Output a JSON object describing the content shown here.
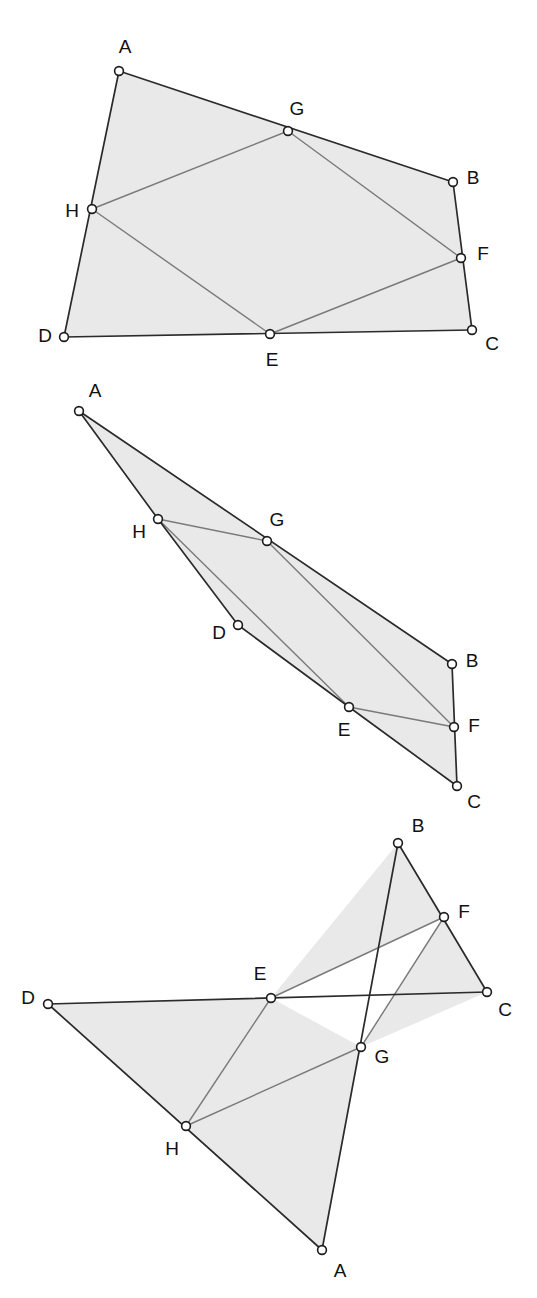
{
  "figure": {
    "width": 537,
    "height": 1298,
    "colors": {
      "background": "#ffffff",
      "fill": "#e9e9e9",
      "outer_edge": "#2b2b2b",
      "inner_edge": "#7a7a7a",
      "vertex_fill": "#ffffff",
      "vertex_stroke": "#1c1c1c",
      "label": "#111111"
    },
    "panels": [
      {
        "id": "panel-1",
        "name": "convex-quadrilateral-case",
        "points": {
          "A": {
            "x": 119,
            "y": 71,
            "label": "A",
            "lx": 125,
            "ly": 48
          },
          "B": {
            "x": 453,
            "y": 182,
            "label": "B",
            "lx": 473,
            "ly": 179
          },
          "C": {
            "x": 472,
            "y": 330,
            "label": "C",
            "lx": 492,
            "ly": 345
          },
          "D": {
            "x": 64,
            "y": 337,
            "label": "D",
            "lx": 45,
            "ly": 337
          },
          "E": {
            "x": 270,
            "y": 334,
            "label": "E",
            "lx": 272,
            "ly": 361
          },
          "F": {
            "x": 461,
            "y": 258,
            "label": "F",
            "lx": 483,
            "ly": 255
          },
          "G": {
            "x": 288,
            "y": 131,
            "label": "G",
            "lx": 297,
            "ly": 110
          },
          "H": {
            "x": 92,
            "y": 209,
            "label": "H",
            "lx": 72,
            "ly": 212
          }
        },
        "fill_polygon": [
          "A",
          "B",
          "C",
          "D"
        ],
        "outer_edges": [
          [
            "A",
            "B"
          ],
          [
            "B",
            "C"
          ],
          [
            "C",
            "D"
          ],
          [
            "D",
            "A"
          ]
        ],
        "inner_edges": [
          [
            "E",
            "F"
          ],
          [
            "F",
            "G"
          ],
          [
            "G",
            "H"
          ],
          [
            "H",
            "E"
          ]
        ],
        "on_edge_points": {
          "E": "DC",
          "F": "BC",
          "G": "AB",
          "H": "DA"
        }
      },
      {
        "id": "panel-2",
        "name": "degenerate-thin-quadrilateral-case",
        "points": {
          "A": {
            "x": 79,
            "y": 411,
            "label": "A",
            "lx": 95,
            "ly": 392
          },
          "B": {
            "x": 452,
            "y": 664,
            "label": "B",
            "lx": 472,
            "ly": 662
          },
          "C": {
            "x": 457,
            "y": 786,
            "label": "C",
            "lx": 474,
            "ly": 803
          },
          "D": {
            "x": 238,
            "y": 625,
            "label": "D",
            "lx": 219,
            "ly": 634
          },
          "E": {
            "x": 349,
            "y": 707,
            "label": "E",
            "lx": 344,
            "ly": 731
          },
          "F": {
            "x": 454,
            "y": 727,
            "label": "F",
            "lx": 474,
            "ly": 727
          },
          "G": {
            "x": 267,
            "y": 541,
            "label": "G",
            "lx": 277,
            "ly": 521
          },
          "H": {
            "x": 158,
            "y": 519,
            "label": "H",
            "lx": 139,
            "ly": 533
          }
        },
        "fill_polygon": [
          "A",
          "B",
          "C",
          "E",
          "D",
          "H"
        ],
        "outer_edges": [
          [
            "A",
            "B"
          ],
          [
            "B",
            "C"
          ],
          [
            "C",
            "E"
          ],
          [
            "E",
            "D"
          ],
          [
            "D",
            "H"
          ],
          [
            "H",
            "A"
          ]
        ],
        "inner_edges": [
          [
            "E",
            "F"
          ],
          [
            "F",
            "G"
          ],
          [
            "G",
            "H"
          ],
          [
            "H",
            "E"
          ]
        ],
        "on_edge_points": {
          "E": "DC",
          "F": "BC",
          "G": "AB",
          "H": "DA"
        }
      },
      {
        "id": "panel-3",
        "name": "crossed-quadrilateral-case",
        "points": {
          "A": {
            "x": 322,
            "y": 1250,
            "label": "A",
            "lx": 340,
            "ly": 1272
          },
          "B": {
            "x": 398,
            "y": 843,
            "label": "B",
            "lx": 418,
            "ly": 827
          },
          "C": {
            "x": 487,
            "y": 992,
            "label": "C",
            "lx": 505,
            "ly": 1011
          },
          "D": {
            "x": 48,
            "y": 1004,
            "label": "D",
            "lx": 28,
            "ly": 999
          },
          "E": {
            "x": 271,
            "y": 998,
            "label": "E",
            "lx": 260,
            "ly": 975
          },
          "F": {
            "x": 444,
            "y": 917,
            "label": "F",
            "lx": 464,
            "ly": 913
          },
          "G": {
            "x": 361,
            "y": 1047,
            "label": "G",
            "lx": 382,
            "ly": 1058
          },
          "H": {
            "x": 186,
            "y": 1126,
            "label": "H",
            "lx": 172,
            "ly": 1150
          }
        },
        "fill_polygons": [
          [
            "B",
            "F",
            "E"
          ],
          [
            "F",
            "C",
            "G"
          ],
          [
            "D",
            "E",
            "H"
          ],
          [
            "H",
            "G",
            "A"
          ],
          [
            "E",
            "G",
            "H"
          ]
        ],
        "outer_edges": [
          [
            "A",
            "B"
          ],
          [
            "B",
            "C"
          ],
          [
            "C",
            "D"
          ],
          [
            "D",
            "A"
          ]
        ],
        "inner_edges": [
          [
            "E",
            "F"
          ],
          [
            "F",
            "G"
          ],
          [
            "G",
            "H"
          ],
          [
            "H",
            "E"
          ]
        ],
        "on_edge_points": {
          "E": "DC",
          "F": "BC",
          "G": "AB",
          "H": "DA"
        }
      }
    ]
  }
}
